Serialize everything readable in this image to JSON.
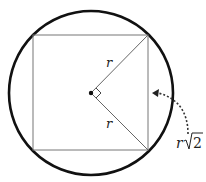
{
  "diagram": {
    "colors": {
      "circle": "#111111",
      "square": "#777777",
      "radius": "#666666",
      "arrow": "#333333",
      "text": "#222222"
    },
    "circle": {
      "cx": 91,
      "cy": 93,
      "r": 83
    },
    "square": {
      "x": 33,
      "y": 35,
      "width": 115,
      "height": 115
    },
    "center_point": {
      "x": 91,
      "y": 93
    },
    "radii": [
      {
        "label": "r",
        "to": "top-right vertex"
      },
      {
        "label": "r",
        "to": "bottom-right vertex"
      }
    ],
    "labels": {
      "radius_upper": "r",
      "radius_lower": "r",
      "side_variable": "r",
      "side_radical": "2"
    },
    "annotation": "Side of square = r√2; the two radii meet at a right angle at the center"
  }
}
